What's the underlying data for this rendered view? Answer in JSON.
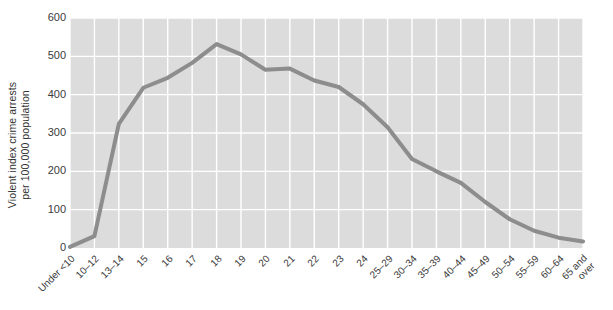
{
  "chart_data": {
    "type": "line",
    "title": "",
    "subtitle": "",
    "xlabel": "",
    "ylabel": "Violent index crime arrests\nper 100,000 population",
    "ylabel_line1": "Violent index crime arrests",
    "ylabel_line2": "per 100,000 population",
    "categories": [
      "Under <10",
      "10–12",
      "13–14",
      "15",
      "16",
      "17",
      "18",
      "19",
      "20",
      "21",
      "22",
      "23",
      "24",
      "25–29",
      "30–34",
      "35–39",
      "40–44",
      "45–49",
      "50–54",
      "55–59",
      "60–64",
      "65 and\nover"
    ],
    "values": [
      3,
      31,
      324,
      418,
      444,
      483,
      532,
      505,
      465,
      468,
      437,
      420,
      375,
      315,
      232,
      200,
      170,
      120,
      75,
      45,
      27,
      17
    ],
    "ylim": [
      0,
      600
    ],
    "yticks": [
      0,
      100,
      200,
      300,
      400,
      500,
      600
    ],
    "ytick_labels": [
      "0",
      "100",
      "200",
      "300",
      "400",
      "500",
      "600"
    ],
    "grid": true,
    "grid_color": "#ffffff",
    "plot_background": "#dcdcdc",
    "line_color": "#8d8d8d",
    "line_width": 4,
    "legend": null,
    "legend_position": "none",
    "annotations": []
  }
}
